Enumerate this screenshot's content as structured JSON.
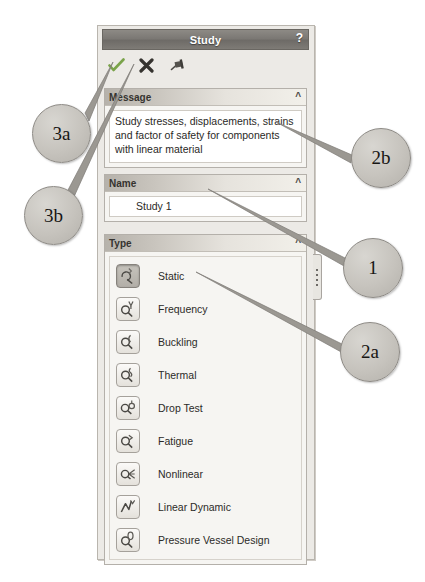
{
  "panel": {
    "title": "Study",
    "help_label": "?",
    "toolbar": [
      {
        "name": "ok-check-icon",
        "label": "OK",
        "glyph": "check",
        "color": "#7aa34a"
      },
      {
        "name": "cancel-x-icon",
        "label": "Cancel",
        "glyph": "x",
        "color": "#3b3a36"
      },
      {
        "name": "pin-icon",
        "label": "Keep Visible",
        "glyph": "pin",
        "color": "#4b4945"
      }
    ],
    "sections": {
      "message": {
        "header": "Message",
        "collapse_glyph": "chevron-up",
        "text": "Study stresses, displacements, strains and factor of safety  for components with linear material"
      },
      "name": {
        "header": "Name",
        "collapse_glyph": "chevron-up",
        "value": "Study 1",
        "placeholder": "Study name"
      },
      "type": {
        "header": "Type",
        "collapse_glyph": "chevron-up",
        "selected": "Static",
        "items": [
          {
            "label": "Static",
            "icon": "static-study-icon"
          },
          {
            "label": "Frequency",
            "icon": "frequency-study-icon"
          },
          {
            "label": "Buckling",
            "icon": "buckling-study-icon"
          },
          {
            "label": "Thermal",
            "icon": "thermal-study-icon"
          },
          {
            "label": "Drop Test",
            "icon": "drop-test-study-icon"
          },
          {
            "label": "Fatigue",
            "icon": "fatigue-study-icon"
          },
          {
            "label": "Nonlinear",
            "icon": "nonlinear-study-icon"
          },
          {
            "label": "Linear Dynamic",
            "icon": "linear-dynamic-study-icon"
          },
          {
            "label": "Pressure Vessel Design",
            "icon": "pressure-vessel-study-icon"
          }
        ]
      }
    }
  },
  "annotations": [
    {
      "id": "3a",
      "label": "3a",
      "points_to": "ok-check-icon"
    },
    {
      "id": "3b",
      "label": "3b",
      "points_to": "cancel-x-icon"
    },
    {
      "id": "2b",
      "label": "2b",
      "points_to": "message-text"
    },
    {
      "id": "1",
      "label": "1",
      "points_to": "name-field"
    },
    {
      "id": "2a",
      "label": "2a",
      "points_to": "type-item-static"
    }
  ],
  "colors": {
    "titlebar": "#7b7874",
    "panel_bg": "#eceae6",
    "section_bg": "#f6f5f2",
    "check_green": "#7aa34a",
    "callout_fill": "#c6c3bd"
  }
}
